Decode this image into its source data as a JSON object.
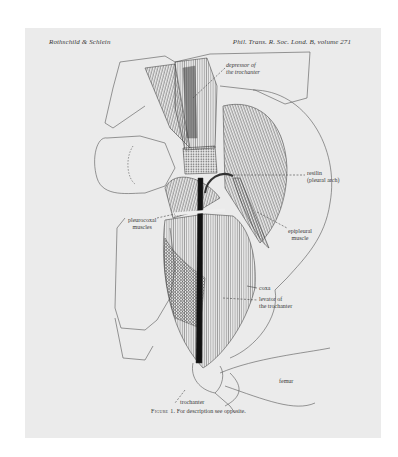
{
  "header": {
    "authors": "Rothschild & Schlein",
    "journal": "Phil. Trans. R. Soc. Lond. B, volume 271"
  },
  "figure": {
    "labels": [
      {
        "id": "depressor",
        "line1": "depressor of",
        "line2": "the trochanter"
      },
      {
        "id": "resilin",
        "line1": "resilin",
        "line2": "(pleural arch)"
      },
      {
        "id": "epipleural",
        "line1": "epipleural",
        "line2": "muscle"
      },
      {
        "id": "pleurocoxal",
        "line1": "pleurocoxal",
        "line2": "muscles"
      },
      {
        "id": "coxa",
        "line1": "coxa",
        "line2": ""
      },
      {
        "id": "levator",
        "line1": "levator of",
        "line2": "the trochanter"
      },
      {
        "id": "femur",
        "line1": "femur",
        "line2": ""
      },
      {
        "id": "trochanter",
        "line1": "trochanter",
        "line2": ""
      }
    ]
  },
  "caption": {
    "figure_label": "Figure 1.",
    "text": "For description see opposite."
  }
}
